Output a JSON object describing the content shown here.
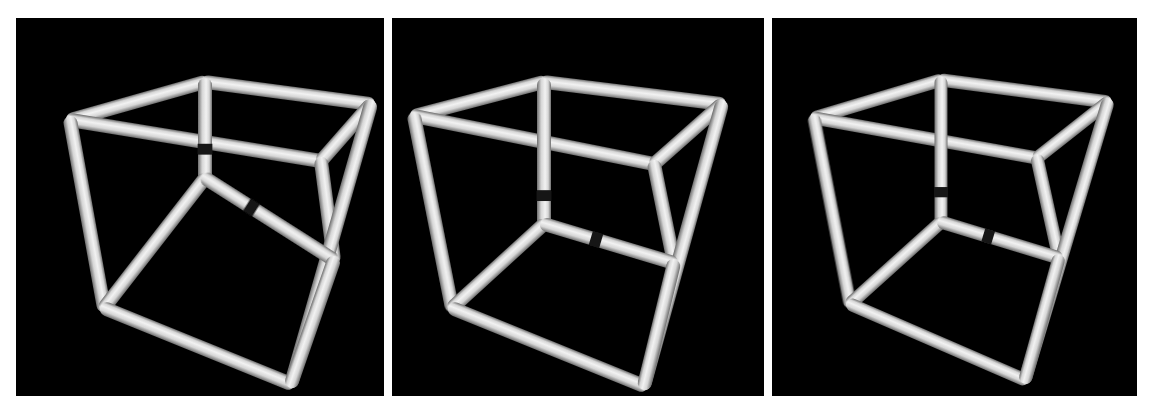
{
  "figure": {
    "title": "",
    "caption": "",
    "background_color": "#ffffff",
    "panel_background_color": "#000000",
    "tube_color": "#d6d6d6",
    "tube_highlight_color": "#f2f2f2",
    "tube_shadow_color": "#6e6e6e",
    "gap_color": "#141414",
    "panel_count": 3
  },
  "panels": [
    {
      "id": "panel-1",
      "label": "",
      "rect": {
        "x": 16,
        "y": 18,
        "w": 368,
        "h": 378
      },
      "view": {
        "azimuth_deg": 34,
        "elevation_deg": 20
      },
      "tube_radius": 7.0,
      "vertices": {
        "back_top_left": {
          "x": 54,
          "y": 102
        },
        "back_top_right": {
          "x": 305,
          "y": 143
        },
        "front_top_left": {
          "x": 189,
          "y": 64
        },
        "front_top_right": {
          "x": 355,
          "y": 86
        },
        "back_bottom_left": {
          "x": 88,
          "y": 290
        },
        "back_bottom_right": {
          "x": 318,
          "y": 242
        },
        "front_bottom_left": {
          "x": 189,
          "y": 160
        },
        "front_bottom_right": {
          "x": 275,
          "y": 366
        }
      },
      "edges": [
        {
          "name": "top-back-left-to-front-top-left",
          "from": "back_top_left",
          "to": "front_top_left",
          "gap": null
        },
        {
          "name": "top-front-left-to-front-top-right",
          "from": "front_top_left",
          "to": "front_top_right",
          "gap": null
        },
        {
          "name": "top-back-left-to-back-top-right",
          "from": "back_top_left",
          "to": "back_top_right",
          "gap": null
        },
        {
          "name": "top-back-right-to-front-top-right",
          "from": "back_top_right",
          "to": "front_top_right",
          "gap": null
        },
        {
          "name": "vertical-back-left",
          "from": "back_top_left",
          "to": "back_bottom_left",
          "gap": null
        },
        {
          "name": "vertical-back-right",
          "from": "back_top_right",
          "to": "back_bottom_right",
          "gap": null
        },
        {
          "name": "vertical-front-right",
          "from": "front_top_right",
          "to": "front_bottom_right",
          "gap": null
        },
        {
          "name": "vertical-center-occluding",
          "from": "front_top_left",
          "to": "front_bottom_left",
          "gap": 0.7
        },
        {
          "name": "bottom-back-left-to-center",
          "from": "back_bottom_left",
          "to": "front_bottom_left",
          "gap": null
        },
        {
          "name": "bottom-center-to-back-right",
          "from": "front_bottom_left",
          "to": "back_bottom_right",
          "gap": 0.36
        },
        {
          "name": "bottom-back-left-to-front",
          "from": "back_bottom_left",
          "to": "front_bottom_right",
          "gap": null
        },
        {
          "name": "bottom-front-to-back-right",
          "from": "front_bottom_right",
          "to": "back_bottom_right",
          "gap": null
        }
      ]
    },
    {
      "id": "panel-2",
      "label": "",
      "rect": {
        "x": 392,
        "y": 18,
        "w": 372,
        "h": 378
      },
      "view": {
        "azimuth_deg": 30,
        "elevation_deg": 19
      },
      "tube_radius": 7.0,
      "vertices": {
        "back_top_left": {
          "x": 22,
          "y": 98
        },
        "back_top_right": {
          "x": 262,
          "y": 146
        },
        "front_top_left": {
          "x": 152,
          "y": 64
        },
        "front_top_right": {
          "x": 330,
          "y": 86
        },
        "back_bottom_left": {
          "x": 60,
          "y": 290
        },
        "back_bottom_right": {
          "x": 282,
          "y": 245
        },
        "front_bottom_left": {
          "x": 152,
          "y": 206
        },
        "front_bottom_right": {
          "x": 252,
          "y": 368
        }
      },
      "edges": [
        {
          "name": "top-back-left-to-front-top-left",
          "from": "back_top_left",
          "to": "front_top_left",
          "gap": null
        },
        {
          "name": "top-front-left-to-front-top-right",
          "from": "front_top_left",
          "to": "front_top_right",
          "gap": null
        },
        {
          "name": "top-back-left-to-back-top-right",
          "from": "back_top_left",
          "to": "back_top_right",
          "gap": null
        },
        {
          "name": "top-back-right-to-front-top-right",
          "from": "back_top_right",
          "to": "front_top_right",
          "gap": null
        },
        {
          "name": "vertical-back-left",
          "from": "back_top_left",
          "to": "back_bottom_left",
          "gap": null
        },
        {
          "name": "vertical-back-right",
          "from": "back_top_right",
          "to": "back_bottom_right",
          "gap": null
        },
        {
          "name": "vertical-front-right",
          "from": "front_top_right",
          "to": "front_bottom_right",
          "gap": null
        },
        {
          "name": "vertical-center-occluding",
          "from": "front_top_left",
          "to": "front_bottom_left",
          "gap": 0.8
        },
        {
          "name": "bottom-back-left-to-center",
          "from": "back_bottom_left",
          "to": "front_bottom_left",
          "gap": null
        },
        {
          "name": "bottom-center-to-back-right",
          "from": "front_bottom_left",
          "to": "back_bottom_right",
          "gap": 0.4
        },
        {
          "name": "bottom-back-left-to-front",
          "from": "back_bottom_left",
          "to": "front_bottom_right",
          "gap": null
        },
        {
          "name": "bottom-front-to-back-right",
          "from": "front_bottom_right",
          "to": "back_bottom_right",
          "gap": null
        }
      ]
    },
    {
      "id": "panel-3",
      "label": "",
      "rect": {
        "x": 772,
        "y": 18,
        "w": 365,
        "h": 378
      },
      "view": {
        "azimuth_deg": 27,
        "elevation_deg": 18
      },
      "tube_radius": 6.6,
      "vertices": {
        "back_top_left": {
          "x": 42,
          "y": 100
        },
        "back_top_right": {
          "x": 265,
          "y": 140
        },
        "front_top_left": {
          "x": 169,
          "y": 62
        },
        "front_top_right": {
          "x": 336,
          "y": 84
        },
        "back_bottom_left": {
          "x": 78,
          "y": 286
        },
        "back_bottom_right": {
          "x": 287,
          "y": 240
        },
        "front_bottom_left": {
          "x": 169,
          "y": 204
        },
        "front_bottom_right": {
          "x": 253,
          "y": 362
        }
      },
      "edges": [
        {
          "name": "top-back-left-to-front-top-left",
          "from": "back_top_left",
          "to": "front_top_left",
          "gap": null
        },
        {
          "name": "top-front-left-to-front-top-right",
          "from": "front_top_left",
          "to": "front_top_right",
          "gap": null
        },
        {
          "name": "top-back-left-to-back-top-right",
          "from": "back_top_left",
          "to": "back_top_right",
          "gap": null
        },
        {
          "name": "top-back-right-to-front-top-right",
          "from": "back_top_right",
          "to": "front_top_right",
          "gap": null
        },
        {
          "name": "vertical-back-left",
          "from": "back_top_left",
          "to": "back_bottom_left",
          "gap": null
        },
        {
          "name": "vertical-back-right",
          "from": "back_top_right",
          "to": "back_bottom_right",
          "gap": null
        },
        {
          "name": "vertical-front-right",
          "from": "front_top_right",
          "to": "front_bottom_right",
          "gap": null
        },
        {
          "name": "vertical-center-occluding",
          "from": "front_top_left",
          "to": "front_bottom_left",
          "gap": 0.79
        },
        {
          "name": "bottom-back-left-to-center",
          "from": "back_bottom_left",
          "to": "front_bottom_left",
          "gap": null
        },
        {
          "name": "bottom-center-to-back-right",
          "from": "front_bottom_left",
          "to": "back_bottom_right",
          "gap": 0.4
        },
        {
          "name": "bottom-back-left-to-front",
          "from": "back_bottom_left",
          "to": "front_bottom_right",
          "gap": null
        },
        {
          "name": "bottom-front-to-back-right",
          "from": "front_bottom_right",
          "to": "back_bottom_right",
          "gap": null
        }
      ]
    }
  ]
}
